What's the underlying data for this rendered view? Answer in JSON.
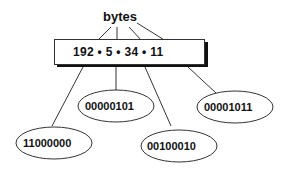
{
  "diagram": {
    "title": "bytes",
    "address": "192 • 5 • 34 • 11",
    "octets": [
      {
        "decimal": "192",
        "binary": "11000000"
      },
      {
        "decimal": "5",
        "binary": "00000101"
      },
      {
        "decimal": "34",
        "binary": "00100010"
      },
      {
        "decimal": "11",
        "binary": "00001011"
      }
    ],
    "colors": {
      "line": "#333333",
      "shadow": "#111111",
      "box_fill": "#ffffff",
      "text": "#111111"
    }
  }
}
